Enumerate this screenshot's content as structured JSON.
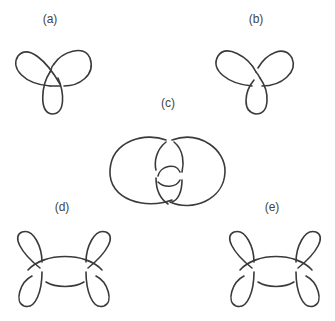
{
  "figure": {
    "panels": [
      {
        "id": "a",
        "label": "(a)",
        "content": "trefoil knot (left-handed)"
      },
      {
        "id": "b",
        "label": "(b)",
        "content": "trefoil knot (right-handed)"
      },
      {
        "id": "c",
        "label": "(c)",
        "content": "two interlinked loops with inner twist"
      },
      {
        "id": "d",
        "label": "(d)",
        "content": "knot with two side loops"
      },
      {
        "id": "e",
        "label": "(e)",
        "content": "knot with two side loops (mirror crossings)"
      }
    ]
  }
}
